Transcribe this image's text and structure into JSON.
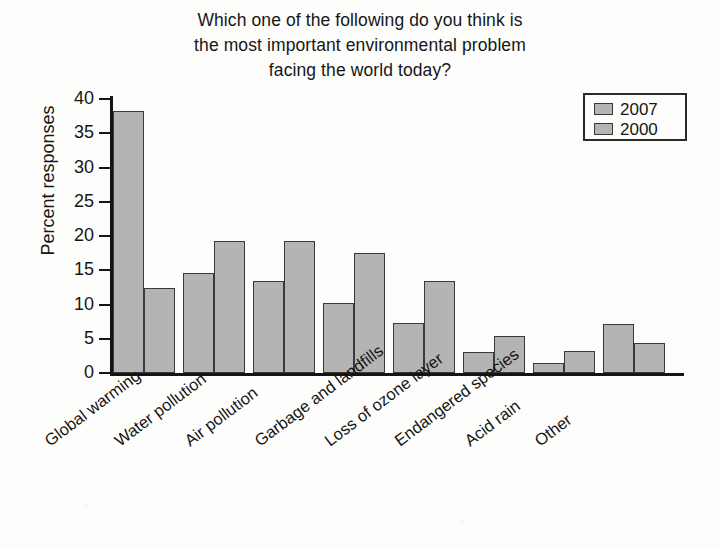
{
  "chart_data": {
    "type": "bar",
    "title": "Which one of the following do you think is the most important environmental problem facing the world today?",
    "title_lines": [
      "Which one of the following do you think is",
      "the most important environmental problem",
      "facing the world today?"
    ],
    "xlabel": "",
    "ylabel": "Percent responses",
    "ylim": [
      0,
      40
    ],
    "yticks": [
      0,
      5,
      10,
      15,
      20,
      25,
      30,
      35,
      40
    ],
    "grid": false,
    "legend_position": "top-right",
    "categories": [
      "Global warming",
      "Water pollution",
      "Air pollution",
      "Garbage and landfills",
      "Loss of ozone layer",
      "Endangered species",
      "Acid rain",
      "Other"
    ],
    "series": [
      {
        "name": "2007",
        "color": "#b4b4b4",
        "values": [
          38.2,
          14.6,
          13.5,
          10.2,
          7.3,
          3.1,
          1.5,
          7.2
        ]
      },
      {
        "name": "2000",
        "color": "#b4b4b4",
        "values": [
          12.4,
          19.3,
          19.3,
          17.5,
          13.5,
          5.4,
          3.2,
          4.4
        ]
      }
    ]
  },
  "colors": {
    "bar_fill": "#b4b4b4",
    "bar_stroke": "#3a3a3a",
    "axis": "#141414",
    "background": "#fdfdfb"
  }
}
